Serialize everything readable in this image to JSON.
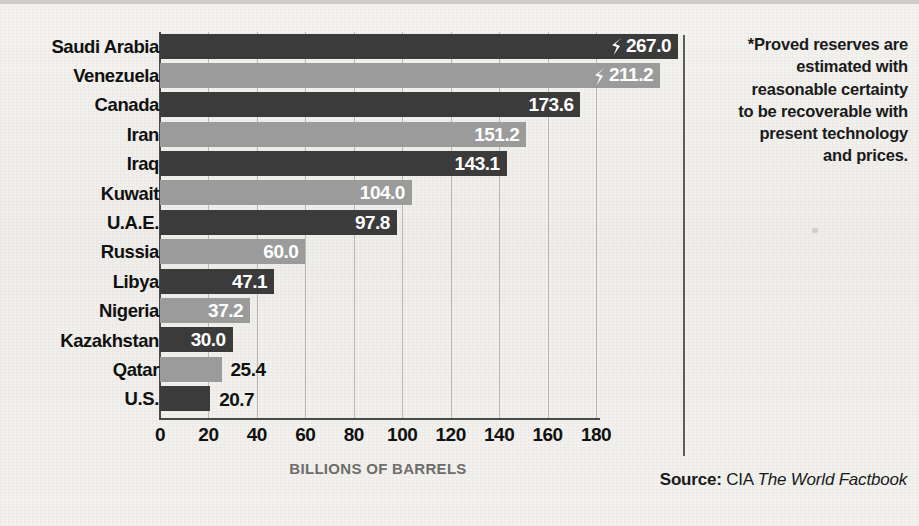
{
  "chart_data": {
    "type": "bar",
    "orientation": "horizontal",
    "title": "",
    "xlabel": "BILLIONS OF BARRELS",
    "ylabel": "",
    "xlim": [
      0,
      180
    ],
    "xticks": [
      0,
      20,
      40,
      60,
      80,
      100,
      120,
      140,
      160,
      180
    ],
    "grid": true,
    "legend": "none",
    "axis_break": true,
    "categories": [
      "Saudi Arabia",
      "Venezuela",
      "Canada",
      "Iran",
      "Iraq",
      "Kuwait",
      "U.A.E.",
      "Russia",
      "Libya",
      "Nigeria",
      "Kazakhstan",
      "Qatar",
      "U.S."
    ],
    "values": [
      267.0,
      211.2,
      173.6,
      151.2,
      143.1,
      104.0,
      97.8,
      60.0,
      47.1,
      37.2,
      30.0,
      25.4,
      20.7
    ],
    "value_labels": [
      "267.0",
      "211.2",
      "173.6",
      "151.2",
      "143.1",
      "104.0",
      "97.8",
      "60.0",
      "47.1",
      "37.2",
      "30.0",
      "25.4",
      "20.7"
    ],
    "bars": [
      {
        "category": "Saudi Arabia",
        "value": 267.0,
        "label": "267.0",
        "shade": "dark",
        "label_position": "inside",
        "broken": true
      },
      {
        "category": "Venezuela",
        "value": 211.2,
        "label": "211.2",
        "shade": "light",
        "label_position": "inside",
        "broken": true
      },
      {
        "category": "Canada",
        "value": 173.6,
        "label": "173.6",
        "shade": "dark",
        "label_position": "inside",
        "broken": false
      },
      {
        "category": "Iran",
        "value": 151.2,
        "label": "151.2",
        "shade": "light",
        "label_position": "inside",
        "broken": false
      },
      {
        "category": "Iraq",
        "value": 143.1,
        "label": "143.1",
        "shade": "dark",
        "label_position": "inside",
        "broken": false
      },
      {
        "category": "Kuwait",
        "value": 104.0,
        "label": "104.0",
        "shade": "light",
        "label_position": "inside",
        "broken": false
      },
      {
        "category": "U.A.E.",
        "value": 97.8,
        "label": "97.8",
        "shade": "dark",
        "label_position": "inside",
        "broken": false
      },
      {
        "category": "Russia",
        "value": 60.0,
        "label": "60.0",
        "shade": "light",
        "label_position": "inside",
        "broken": false
      },
      {
        "category": "Libya",
        "value": 47.1,
        "label": "47.1",
        "shade": "dark",
        "label_position": "inside",
        "broken": false
      },
      {
        "category": "Nigeria",
        "value": 37.2,
        "label": "37.2",
        "shade": "light",
        "label_position": "inside",
        "broken": false
      },
      {
        "category": "Kazakhstan",
        "value": 30.0,
        "label": "30.0",
        "shade": "dark",
        "label_position": "inside",
        "broken": false
      },
      {
        "category": "Qatar",
        "value": 25.4,
        "label": "25.4",
        "shade": "light",
        "label_position": "outside",
        "broken": false
      },
      {
        "category": "U.S.",
        "value": 20.7,
        "label": "20.7",
        "shade": "dark",
        "label_position": "outside",
        "broken": false
      }
    ],
    "colors": {
      "dark_bar": "#3b3b3b",
      "light_bar": "#9b9b9b",
      "axis": "#4a4a4a",
      "gridline": "#b9b8b4",
      "background": "#f2f1ee",
      "axis_title": "#6e6d6b"
    }
  },
  "note": {
    "lines": [
      "*Proved reserves are",
      "estimated with",
      "reasonable certainty",
      "to be recoverable with",
      "present technology",
      "and prices."
    ]
  },
  "source": {
    "label": "Source:",
    "agency": "CIA",
    "publication": "The World Factbook"
  }
}
